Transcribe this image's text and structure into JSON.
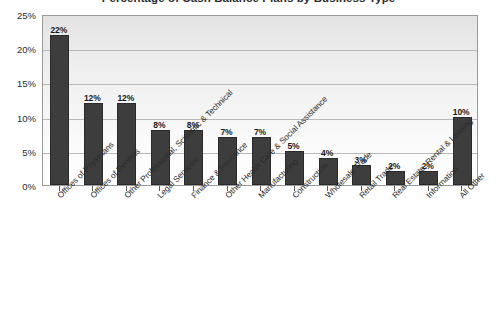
{
  "chart_data": {
    "type": "bar",
    "title": "Percentage of Cash Balance Plans by Business Type",
    "xlabel": "",
    "ylabel": "",
    "ylim": [
      0,
      25
    ],
    "ytick_labels": [
      "0%",
      "5%",
      "10%",
      "15%",
      "20%",
      "25%"
    ],
    "ytick_values": [
      0,
      5,
      10,
      15,
      20,
      25
    ],
    "grid": true,
    "legend": false,
    "value_label_suffix": "%",
    "bar_color": "#3d3d3d",
    "categories": [
      "Offices of Physicians",
      "Offices of Dentists",
      "Other Professional, Scientific & Technical",
      "Legal Services",
      "Finance & Insurance",
      "Other Health Care & Social Assistance",
      "Manufacturing",
      "Construction",
      "Wholesale Trade",
      "Retail Trade",
      "Real Estate, Rental & Leasing",
      "Information",
      "All Other"
    ],
    "values": [
      22,
      12,
      12,
      8,
      8,
      7,
      7,
      5,
      4,
      3,
      2,
      2,
      10
    ],
    "value_labels": [
      "22%",
      "12%",
      "12%",
      "8%",
      "8%",
      "7%",
      "7%",
      "5%",
      "4%",
      "3%",
      "2%",
      "2%",
      "10%"
    ]
  }
}
